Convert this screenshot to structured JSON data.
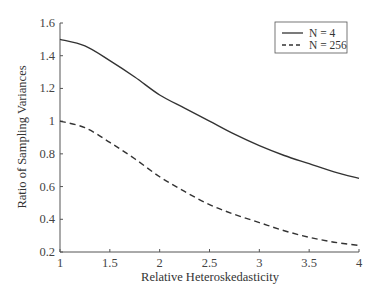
{
  "chart_data": {
    "type": "line",
    "title": "",
    "xlabel": "Relative Heteroskedasticity",
    "ylabel": "Ratio of Sampling Variances",
    "xlim": [
      1,
      4
    ],
    "ylim": [
      0.2,
      1.6
    ],
    "xticks": [
      1,
      1.5,
      2,
      2.5,
      3,
      3.5,
      4
    ],
    "xtick_labels": [
      "1",
      "1.5",
      "2",
      "2.5",
      "3",
      "3.5",
      "4"
    ],
    "yticks": [
      0.2,
      0.4,
      0.6,
      0.8,
      1.0,
      1.2,
      1.4,
      1.6
    ],
    "ytick_labels": [
      "0.2",
      "0.4",
      "0.6",
      "0.8",
      "1",
      "1.2",
      "1.4",
      "1.6"
    ],
    "grid": false,
    "legend_position": "upper right",
    "x": [
      1.0,
      1.25,
      1.5,
      1.75,
      2.0,
      2.25,
      2.5,
      2.75,
      3.0,
      3.25,
      3.5,
      3.75,
      4.0
    ],
    "series": [
      {
        "name": "N = 4",
        "style": "solid",
        "color": "#333333",
        "values": [
          1.5,
          1.46,
          1.37,
          1.27,
          1.16,
          1.08,
          1.0,
          0.92,
          0.85,
          0.79,
          0.74,
          0.69,
          0.65
        ]
      },
      {
        "name": "N = 256",
        "style": "dashed",
        "color": "#333333",
        "values": [
          1.0,
          0.96,
          0.87,
          0.77,
          0.66,
          0.57,
          0.49,
          0.43,
          0.38,
          0.33,
          0.29,
          0.26,
          0.24
        ]
      }
    ]
  }
}
